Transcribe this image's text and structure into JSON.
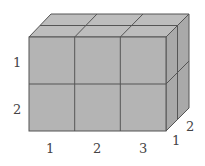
{
  "diagram": {
    "type": "cuboid-of-unit-cubes",
    "dimensions": {
      "width": 3,
      "height": 2,
      "depth": 2
    },
    "colors": {
      "face_front": "#b4b4b4",
      "face_top": "#bdbdbd",
      "face_right": "#a9a9a9",
      "edge": "#555555",
      "label": "#444444"
    },
    "labels": {
      "height": [
        "1",
        "2"
      ],
      "width": [
        "1",
        "2",
        "3"
      ],
      "depth": [
        "1",
        "2"
      ]
    }
  }
}
